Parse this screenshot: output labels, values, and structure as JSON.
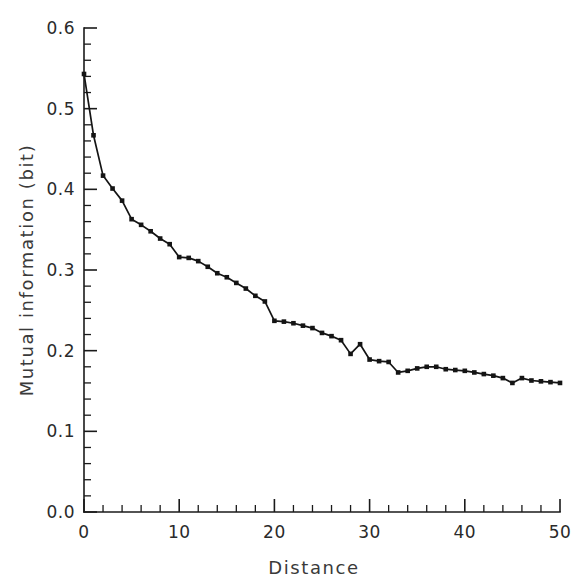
{
  "chart_data": {
    "type": "line",
    "title": "",
    "xlabel": "Distance",
    "ylabel": "Mutual information (bit)",
    "xlim": [
      0,
      50
    ],
    "ylim": [
      0.0,
      0.6
    ],
    "grid": false,
    "legend": null,
    "marker": "filled-square",
    "line_color": "#141414",
    "x_ticks_major": [
      0,
      10,
      20,
      30,
      40,
      50
    ],
    "x_tick_labels": [
      "0",
      "10",
      "20",
      "30",
      "40",
      "50"
    ],
    "x_minor_interval": 2,
    "y_ticks_major": [
      0.0,
      0.1,
      0.2,
      0.3,
      0.4,
      0.5,
      0.6
    ],
    "y_tick_labels": [
      "0.0",
      "0.1",
      "0.2",
      "0.3",
      "0.4",
      "0.5",
      "0.6"
    ],
    "y_minor_interval": 0.02,
    "x": [
      0,
      1,
      2,
      3,
      4,
      5,
      6,
      7,
      8,
      9,
      10,
      11,
      12,
      13,
      14,
      15,
      16,
      17,
      18,
      19,
      20,
      21,
      22,
      23,
      24,
      25,
      26,
      27,
      28,
      29,
      30,
      31,
      32,
      33,
      34,
      35,
      36,
      37,
      38,
      39,
      40,
      41,
      42,
      43,
      44,
      45,
      46,
      47,
      48,
      49,
      50
    ],
    "values": [
      0.543,
      0.467,
      0.417,
      0.401,
      0.386,
      0.363,
      0.356,
      0.348,
      0.339,
      0.332,
      0.316,
      0.315,
      0.311,
      0.304,
      0.296,
      0.291,
      0.284,
      0.277,
      0.268,
      0.261,
      0.237,
      0.236,
      0.234,
      0.231,
      0.228,
      0.222,
      0.218,
      0.213,
      0.196,
      0.208,
      0.189,
      0.187,
      0.186,
      0.173,
      0.175,
      0.178,
      0.18,
      0.18,
      0.177,
      0.176,
      0.175,
      0.173,
      0.171,
      0.169,
      0.166,
      0.16,
      0.166,
      0.163,
      0.162,
      0.161,
      0.16
    ]
  },
  "axes": {
    "y_axis_name": "mutual-information-axis",
    "x_axis_name": "distance-axis"
  }
}
